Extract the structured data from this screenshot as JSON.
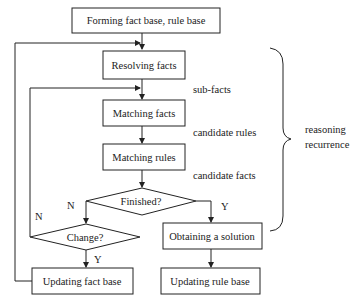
{
  "diagram": {
    "title": "",
    "nodes": {
      "forming": {
        "label": "Forming fact base, rule base",
        "shape": "rectangle"
      },
      "resolving": {
        "label": "Resolving facts",
        "shape": "rectangle"
      },
      "matching_facts": {
        "label": "Matching facts",
        "shape": "rectangle"
      },
      "matching_rules": {
        "label": "Matching rules",
        "shape": "rectangle"
      },
      "finished": {
        "label": "Finished?",
        "shape": "diamond"
      },
      "change": {
        "label": "Change?",
        "shape": "diamond"
      },
      "solution": {
        "label": "Obtaining a solution",
        "shape": "rectangle"
      },
      "update_fact": {
        "label": "Updating fact base",
        "shape": "rectangle"
      },
      "update_rule": {
        "label": "Updating rule base",
        "shape": "rectangle"
      }
    },
    "edge_labels": {
      "sub_facts": "sub-facts",
      "candidate_rules": "candidate rules",
      "candidate_facts": "candidate facts",
      "finished_no": "N",
      "finished_yes": "Y",
      "change_no": "N",
      "change_yes": "Y"
    },
    "edges": [
      {
        "from": "forming",
        "to": "resolving"
      },
      {
        "from": "resolving",
        "to": "matching_facts",
        "label": "sub-facts"
      },
      {
        "from": "matching_facts",
        "to": "matching_rules",
        "label": "candidate rules"
      },
      {
        "from": "matching_rules",
        "to": "finished",
        "label": "candidate facts"
      },
      {
        "from": "finished",
        "to": "change",
        "label": "N"
      },
      {
        "from": "finished",
        "to": "solution",
        "label": "Y"
      },
      {
        "from": "change",
        "to": "matching_facts",
        "label": "N"
      },
      {
        "from": "change",
        "to": "update_fact",
        "label": "Y"
      },
      {
        "from": "update_fact",
        "to": "resolving"
      },
      {
        "from": "solution",
        "to": "update_rule"
      }
    ],
    "brace": {
      "label_line1": "reasoning",
      "label_line2": "recurrence"
    }
  }
}
